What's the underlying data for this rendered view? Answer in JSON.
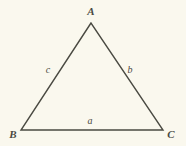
{
  "figure": {
    "background_color": "#faf8ee",
    "stroke_color": "#4a4a42",
    "text_color": "#4a4a42",
    "stroke_width": 1.4,
    "width": 186,
    "height": 146
  },
  "vertices": [
    {
      "id": "A",
      "label": "A",
      "x": 91,
      "y": 23,
      "label_x": 91,
      "label_y": 11
    },
    {
      "id": "B",
      "label": "B",
      "x": 21,
      "y": 130,
      "label_x": 13,
      "label_y": 134
    },
    {
      "id": "C",
      "label": "C",
      "x": 163,
      "y": 130,
      "label_x": 171,
      "label_y": 134
    }
  ],
  "sides": [
    {
      "id": "a",
      "label": "a",
      "between": "B-C",
      "label_x": 90,
      "label_y": 121
    },
    {
      "id": "b",
      "label": "b",
      "between": "A-C",
      "label_x": 130,
      "label_y": 70
    },
    {
      "id": "c",
      "label": "c",
      "between": "A-B",
      "label_x": 48,
      "label_y": 70
    }
  ],
  "polygon_points": "91,23 21,130 163,130"
}
